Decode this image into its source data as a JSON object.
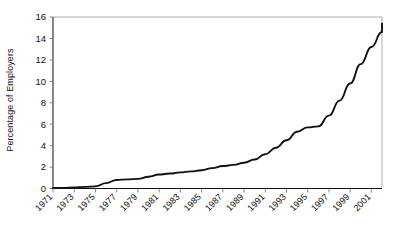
{
  "chart_data": {
    "type": "line",
    "title": "",
    "xlabel": "",
    "ylabel": "Percentage of Employers",
    "xlim": [
      1971,
      2002
    ],
    "ylim": [
      0,
      16
    ],
    "ytick_values": [
      0,
      2,
      4,
      6,
      8,
      10,
      12,
      14,
      16
    ],
    "ytick_labels": [
      "0",
      "2",
      "4",
      "6",
      "8",
      "10",
      "12",
      "14",
      "16"
    ],
    "xtick_labels": [
      "1971",
      "1973",
      "1975",
      "1977",
      "1979",
      "1981",
      "1983",
      "1985",
      "1987",
      "1989",
      "1991",
      "1993",
      "1995",
      "1997",
      "1999",
      "2001"
    ],
    "xtick_values": [
      1971,
      1973,
      1975,
      1977,
      1979,
      1981,
      1983,
      1985,
      1987,
      1989,
      1991,
      1993,
      1995,
      1997,
      1999,
      2001
    ],
    "grid": false,
    "legend": false,
    "legend_position": "none",
    "series": [
      {
        "name": "Percentage of Employers",
        "x": [
          1971,
          1972,
          1973,
          1974,
          1975,
          1976,
          1977,
          1978,
          1979,
          1980,
          1981,
          1982,
          1983,
          1984,
          1985,
          1986,
          1987,
          1988,
          1989,
          1990,
          1991,
          1992,
          1993,
          1994,
          1995,
          1996,
          1997,
          1998,
          1999,
          2000,
          2001,
          2002
        ],
        "values": [
          0.05,
          0.05,
          0.1,
          0.15,
          0.2,
          0.5,
          0.8,
          0.85,
          0.9,
          1.1,
          1.3,
          1.4,
          1.5,
          1.6,
          1.7,
          1.9,
          2.1,
          2.2,
          2.4,
          2.7,
          3.2,
          3.8,
          4.5,
          5.3,
          5.7,
          5.8,
          6.8,
          8.2,
          9.8,
          11.6,
          13.2,
          14.6
        ]
      }
    ],
    "annotations": [],
    "plateau_value": 15.4,
    "axis_color": "#111111",
    "line_color": "#111111",
    "background_color": "#ffffff"
  }
}
